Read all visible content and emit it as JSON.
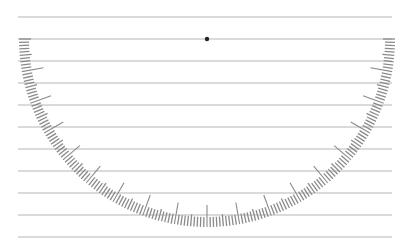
{
  "scene": {
    "description": "Semicircular protractor-style tick scale over ruled lines",
    "ruled_lines": {
      "count": 11,
      "start_y": 17,
      "spacing": 22,
      "x_start": 18,
      "x_end": 392,
      "color": "#b5b5b5"
    },
    "arc": {
      "center_x": 207,
      "center_y": 39,
      "outer_radius": 188,
      "minor_tick_length": 10,
      "mid_tick_length": 12,
      "major_tick_length": 22,
      "tick_step_degrees": 1,
      "major_every": 10,
      "mid_every": 5,
      "start_angle": 0,
      "end_angle": 180,
      "tick_color": "#8a8a8a"
    },
    "center_dot": {
      "color": "#222222",
      "radius": 2.2
    }
  }
}
